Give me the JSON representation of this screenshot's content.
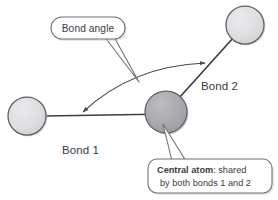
{
  "figure": {
    "colors": {
      "background": "#ffffff",
      "outer_atom_fill": "#dcdcde",
      "central_atom_fill": "#a9a9ad",
      "atom_stroke": "#5e5e63",
      "bond_stroke": "#3d3d41",
      "arc_stroke": "#4a4a4e",
      "callout_stroke": "#6e6e73",
      "callout_fill": "#ffffff",
      "text": "#3b3b3f",
      "shadow": "#c9c9cc"
    }
  },
  "atoms": [
    {
      "name": "left-atom",
      "role": "terminal",
      "cx": 27,
      "cy": 116,
      "r": 19,
      "shade": "light"
    },
    {
      "name": "top-right-atom",
      "role": "terminal",
      "cx": 245,
      "cy": 25,
      "r": 19,
      "shade": "light"
    },
    {
      "name": "central-atom",
      "role": "central",
      "cx": 166,
      "cy": 112,
      "r": 21,
      "shade": "dark"
    }
  ],
  "bonds": [
    {
      "name": "bond-1",
      "label": "Bond 1",
      "label_x": 62,
      "label_y": 150,
      "from": "left-atom",
      "to": "central-atom"
    },
    {
      "name": "bond-2",
      "label": "Bond 2",
      "label_x": 201,
      "label_y": 87,
      "from": "central-atom",
      "to": "top-right-atom"
    }
  ],
  "angle_arc": {
    "name": "bond-angle-arc",
    "arrowheads": "both",
    "start": {
      "x": 79,
      "y": 114
    },
    "end": {
      "x": 208,
      "y": 62
    }
  },
  "callouts": [
    {
      "name": "bond-angle-callout",
      "shape": "pill",
      "text": "Bond angle",
      "x": 51,
      "y": 17,
      "width": 74,
      "height": 22,
      "text_x": 88,
      "text_y": 32
    },
    {
      "name": "central-atom-callout",
      "shape": "rounded-rect",
      "lines": [
        {
          "bold": "Central atom",
          "rest": ": shared"
        },
        {
          "bold": "",
          "rest": "by both bonds 1 and 2"
        }
      ],
      "x": 148,
      "y": 159,
      "width": 124,
      "height": 34,
      "line1_bold_x": 157,
      "line1_rest_x": 216,
      "line1_y": 173,
      "line2_x": 160,
      "line2_y": 186
    }
  ]
}
